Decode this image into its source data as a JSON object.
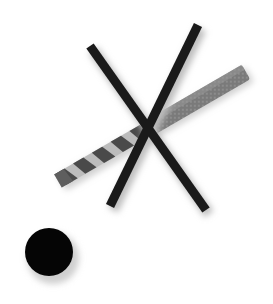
{
  "illustration": {
    "title": "Do not drill here",
    "background": "#ffffff",
    "cross": {
      "color": "#1a1a1a",
      "shadow": "#bdbdbd",
      "bars": [
        {
          "x1": 90,
          "y1": 46,
          "x2": 206,
          "y2": 210,
          "width": 9
        },
        {
          "x1": 198,
          "y1": 25,
          "x2": 110,
          "y2": 206,
          "width": 9
        }
      ]
    },
    "drill_bit": {
      "tip": {
        "x": 58,
        "y": 181
      },
      "shank_end": {
        "x": 246,
        "y": 72
      },
      "thickness": 17,
      "shank_color": "#7a7a7a",
      "flute_dark": "#4a4a4a",
      "flute_light": "#bcbcbc",
      "tip_color": "#5e5e5e"
    },
    "dot": {
      "cx": 49,
      "cy": 252,
      "r": 24,
      "color": "#050505",
      "shadow": "#cfcfcf"
    }
  }
}
